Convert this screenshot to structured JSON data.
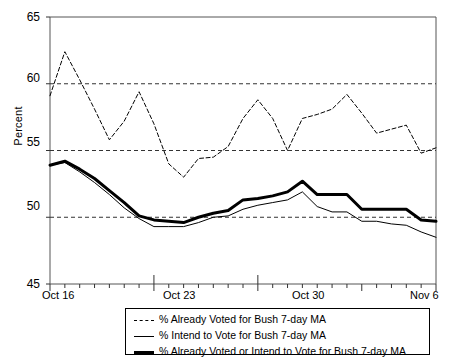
{
  "chart_data": {
    "type": "line",
    "title": "",
    "xlabel": "",
    "ylabel": "Percent",
    "ylim": [
      45,
      65
    ],
    "yticks": [
      45,
      50,
      55,
      60,
      65
    ],
    "grid": "horizontal dashed at 50, 55, 60",
    "legend_position": "below-plot",
    "x": [
      "Oct 16",
      "Oct 17",
      "Oct 18",
      "Oct 19",
      "Oct 20",
      "Oct 21",
      "Oct 22",
      "Oct 23",
      "Oct 24",
      "Oct 25",
      "Oct 26",
      "Oct 27",
      "Oct 28",
      "Oct 29",
      "Oct 30",
      "Oct 31",
      "Nov 1",
      "Nov 2",
      "Nov 3",
      "Nov 4",
      "Nov 5",
      "Nov 6"
    ],
    "xtick_labels": [
      "Oct 16",
      "Oct 23",
      "Oct 30",
      "Nov 6"
    ],
    "xtick_indices": [
      0,
      7,
      14,
      21
    ],
    "series": [
      {
        "name": "% Already Voted for Bush 7-day MA",
        "style": "dashed",
        "width": 1,
        "color": "#000000",
        "values": [
          59.1,
          62.4,
          60.3,
          58.1,
          55.8,
          57.2,
          59.4,
          57.0,
          54.0,
          53.0,
          54.4,
          54.5,
          55.3,
          57.4,
          58.8,
          57.4,
          55.0,
          57.4,
          57.7,
          58.1,
          59.2,
          57.8
        ]
      },
      {
        "name": "% Intend to Vote for Bush 7-day MA",
        "style": "solid",
        "width": 1,
        "color": "#000000",
        "values": [
          53.9,
          54.1,
          53.4,
          52.6,
          51.7,
          50.7,
          49.9,
          49.3,
          49.3,
          49.3,
          49.6,
          50.0,
          50.1,
          50.6,
          50.9,
          51.1,
          51.3,
          51.9,
          50.8,
          50.4,
          50.4,
          49.7
        ]
      },
      {
        "name": "% Already Voted or Intend to Vote for Bush 7-day MA",
        "style": "solid",
        "width": 3,
        "color": "#000000",
        "values": [
          53.9,
          54.2,
          53.6,
          52.9,
          52.0,
          51.1,
          50.1,
          49.8,
          49.7,
          49.6,
          50.0,
          50.3,
          50.5,
          51.3,
          51.4,
          51.6,
          51.9,
          52.7,
          51.7,
          51.7,
          51.7,
          50.6
        ]
      }
    ],
    "series_extended_right": {
      "note": "trailing segment values continuing to right edge",
      "already_voted": [
        56.3,
        56.6,
        56.9,
        54.8,
        55.2
      ],
      "intend": [
        49.7,
        49.5,
        49.4,
        48.9,
        48.5
      ],
      "combined": [
        50.6,
        50.6,
        50.6,
        49.8,
        49.7
      ]
    }
  },
  "legend": {
    "items": [
      {
        "label": "% Already Voted for Bush 7-day MA",
        "style": "dashed"
      },
      {
        "label": "% Intend to Vote for Bush 7-day MA",
        "style": "thin"
      },
      {
        "label": "% Already Voted or Intend to Vote for Bush 7-day MA",
        "style": "thick"
      }
    ]
  },
  "axes": {
    "y_label": "Percent",
    "y_ticks": [
      "65",
      "60",
      "55",
      "50",
      "45"
    ],
    "x_ticks": [
      "Oct 16",
      "Oct 23",
      "Oct 30",
      "Nov 6"
    ]
  }
}
